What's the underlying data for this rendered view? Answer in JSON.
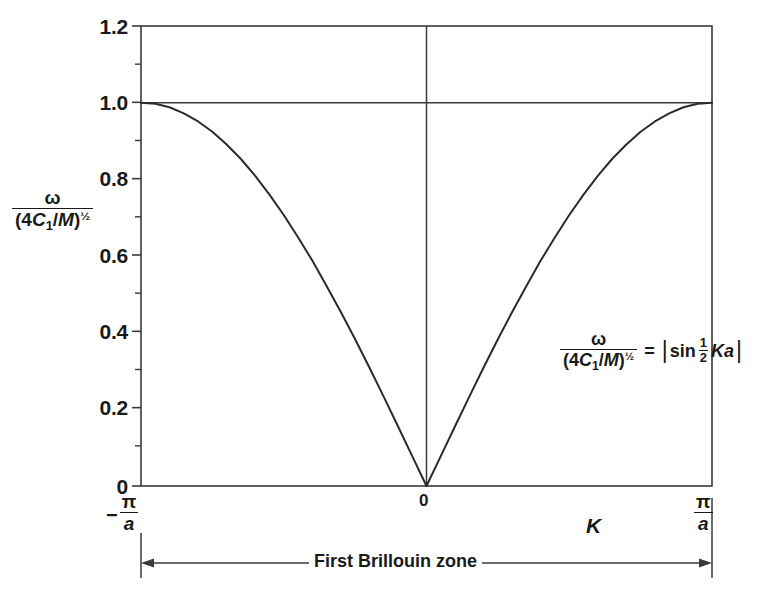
{
  "chart_data": {
    "type": "line",
    "title": "",
    "subtitle": "",
    "xlabel": "K",
    "ylabel": "ω / (4C₁/M)^½",
    "equation": "ω/(4C₁/M)^½ = |sin ½Ka|",
    "xlim": [
      -1,
      1
    ],
    "ylim": [
      0,
      1.2
    ],
    "x_unit": "π/a",
    "x_tick_labels": [
      "-π/a",
      "0",
      "π/a"
    ],
    "x_tick_values": [
      -1,
      0,
      1
    ],
    "y_tick_labels": [
      "0",
      "0.2",
      "0.4",
      "0.6",
      "0.8",
      "1.0",
      "1.2"
    ],
    "y_tick_values": [
      0,
      0.2,
      0.4,
      0.6,
      0.8,
      1.0,
      1.2
    ],
    "y_minor_tick_values": [
      0.1,
      0.3,
      0.5,
      0.7,
      0.9,
      1.1
    ],
    "grid": false,
    "legend": false,
    "reference_lines": [
      {
        "name": "unity-horizontal-line",
        "orientation": "horizontal",
        "value": 1.0
      },
      {
        "name": "zone-center-vertical-line",
        "orientation": "vertical",
        "value": 0
      }
    ],
    "series": [
      {
        "name": "omega-over-4C1-over-M",
        "formula": "|sin(Ka/2)|",
        "color": "#2b2b2b",
        "x": [
          -1.0,
          -0.95,
          -0.9,
          -0.85,
          -0.8,
          -0.75,
          -0.7,
          -0.65,
          -0.6,
          -0.55,
          -0.5,
          -0.45,
          -0.4,
          -0.35,
          -0.3,
          -0.25,
          -0.2,
          -0.15,
          -0.1,
          -0.05,
          0.0,
          0.05,
          0.1,
          0.15,
          0.2,
          0.25,
          0.3,
          0.35,
          0.4,
          0.45,
          0.5,
          0.55,
          0.6,
          0.65,
          0.7,
          0.75,
          0.8,
          0.85,
          0.9,
          0.95,
          1.0
        ],
        "y": [
          1.0,
          0.997,
          0.988,
          0.972,
          0.951,
          0.924,
          0.891,
          0.853,
          0.809,
          0.76,
          0.707,
          0.649,
          0.588,
          0.522,
          0.454,
          0.383,
          0.309,
          0.233,
          0.156,
          0.078,
          0.0,
          0.078,
          0.156,
          0.233,
          0.309,
          0.383,
          0.454,
          0.522,
          0.588,
          0.649,
          0.707,
          0.76,
          0.809,
          0.853,
          0.891,
          0.924,
          0.951,
          0.972,
          0.988,
          0.997,
          1.0
        ]
      }
    ],
    "annotations": [
      {
        "name": "brillouin-zone-span",
        "text": "First Brillouin zone",
        "from": -1,
        "to": 1
      }
    ]
  },
  "ylabel_parts": {
    "numerator": "ω",
    "denominator_open": "(4",
    "denominator_c": "C",
    "denominator_c_sub": "1",
    "denominator_slash": "/",
    "denominator_m": "M",
    "denominator_close": ")",
    "denominator_exp": "½"
  },
  "annotation_eq": {
    "numerator": "ω",
    "denominator_open": "(4",
    "denominator_c": "C",
    "denominator_c_sub": "1",
    "denominator_slash": "/",
    "denominator_m": "M",
    "denominator_close": ")",
    "denominator_exp": "½",
    "equals": "=",
    "bar_open": "|",
    "sin": "sin",
    "half_num": "1",
    "half_den": "2",
    "ka": "Ka",
    "bar_close": "|"
  },
  "axis": {
    "x_name": "K",
    "tick_left_minus": "−",
    "tick_pi": "π",
    "tick_a": "a",
    "tick_zero": "0"
  },
  "y_ticks": [
    {
      "label": "1.2",
      "value": 1.2
    },
    {
      "label": "1.0",
      "value": 1.0
    },
    {
      "label": "0.8",
      "value": 0.8
    },
    {
      "label": "0.6",
      "value": 0.6
    },
    {
      "label": "0.4",
      "value": 0.4
    },
    {
      "label": "0.2",
      "value": 0.2
    },
    {
      "label": "0",
      "value": 0
    }
  ],
  "brillouin": {
    "label": "First Brillouin zone"
  },
  "colors": {
    "background": "#ffffff",
    "ink": "#1a1a1a",
    "curve": "#2b2b2b",
    "frame": "#3a3a3a"
  }
}
